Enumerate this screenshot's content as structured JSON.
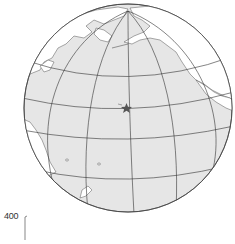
{
  "map": {
    "projection": "orthographic",
    "center_region": "Central Pacific Ocean",
    "colors": {
      "ocean": "#e6e6e6",
      "land": "#ffffff",
      "outline": "#555555",
      "graticule": "#333333",
      "marker": "#555555"
    },
    "marker": {
      "type": "star-icon",
      "label": "Hawaii"
    },
    "scale_bar": {
      "value": "400"
    }
  }
}
